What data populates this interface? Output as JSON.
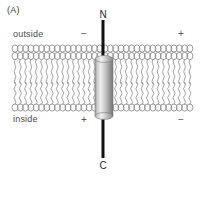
{
  "figure": {
    "panel_label": "(A)",
    "labels": {
      "outside": "outside",
      "inside": "inside",
      "n_terminus": "N",
      "c_terminus": "C"
    },
    "charges": {
      "outside_left": "−",
      "outside_right": "+",
      "inside_left": "+",
      "inside_right": "−"
    },
    "colors": {
      "background": "#ffffff",
      "lipid_stroke": "#8a8a8a",
      "protein_light": "#e3e3e3",
      "protein_mid": "#b4b4b4",
      "protein_dark": "#6f6f6f",
      "chain_line": "#111111",
      "text": "#3a3a3a"
    },
    "geometry": {
      "membrane_left": 12,
      "membrane_right": 196,
      "membrane_top": 44,
      "membrane_bottom": 113,
      "protein_left": 95,
      "protein_right": 113,
      "protein_top": 59,
      "protein_bottom": 116,
      "chain_x": 103,
      "chain_top": 20,
      "chain_bottom": 158
    },
    "icons": {
      "lipid_head": "lipid-head-circle",
      "lipid_tail": "lipid-tail-wave",
      "protein_cylinder": "alpha-helix-cylinder",
      "polypeptide_chain": "polypeptide-chain-line"
    }
  }
}
